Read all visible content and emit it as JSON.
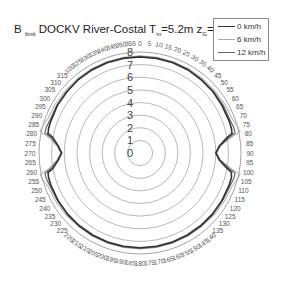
{
  "chart_data": {
    "type": "polar-line",
    "title": {
      "prefix": "B",
      "prefix_sub": "limit",
      "main": "DOCKV River-Costal T",
      "t_sub": "m",
      "t_value": "=5.2m z",
      "z_sub": "G",
      "z_value": "=16m"
    },
    "radial_axis": {
      "range": [
        0,
        8
      ],
      "ticks": [
        0,
        1,
        2,
        3,
        4,
        5,
        6,
        7,
        8
      ]
    },
    "angular_axis": {
      "unit": "degrees",
      "direction": "clockwise",
      "zero": "top",
      "step": 5,
      "range": [
        0,
        355
      ]
    },
    "legend": {
      "position": "top-right",
      "entries": [
        "0 km/h",
        "6 km/h",
        "12 km/h"
      ]
    },
    "angles": [
      0,
      10,
      20,
      30,
      40,
      50,
      60,
      70,
      75,
      78,
      80,
      85,
      90,
      95,
      100,
      102,
      105,
      110,
      120,
      130,
      140,
      150,
      160,
      170,
      180,
      190,
      200,
      210,
      220,
      230,
      240,
      250,
      255,
      258,
      260,
      265,
      270,
      275,
      280,
      282,
      285,
      290,
      300,
      310,
      320,
      330,
      340,
      350
    ],
    "series": [
      {
        "name": "0 km/h",
        "color": "#333333",
        "values": [
          7.6,
          7.6,
          7.6,
          7.6,
          7.55,
          7.55,
          7.5,
          7.5,
          7.5,
          7.45,
          7.0,
          6.3,
          6.0,
          6.3,
          7.0,
          7.4,
          7.5,
          7.5,
          7.5,
          7.5,
          7.5,
          7.5,
          7.5,
          7.5,
          7.5,
          7.5,
          7.5,
          7.5,
          7.5,
          7.5,
          7.5,
          7.5,
          7.5,
          7.45,
          7.0,
          6.5,
          6.2,
          6.5,
          7.0,
          7.45,
          7.5,
          7.5,
          7.55,
          7.55,
          7.6,
          7.6,
          7.6,
          7.6
        ]
      },
      {
        "name": "6 km/h",
        "color": "#aaaaaa",
        "values": [
          7.7,
          7.7,
          7.7,
          7.7,
          7.7,
          7.7,
          7.75,
          7.8,
          8.0,
          8.1,
          7.4,
          6.4,
          6.05,
          6.4,
          7.4,
          8.1,
          8.0,
          7.75,
          7.7,
          7.65,
          7.6,
          7.6,
          7.6,
          7.6,
          7.6,
          7.6,
          7.6,
          7.6,
          7.6,
          7.65,
          7.7,
          7.75,
          8.0,
          8.1,
          7.4,
          6.6,
          6.25,
          6.6,
          7.4,
          8.1,
          8.0,
          7.8,
          7.75,
          7.7,
          7.7,
          7.7,
          7.7,
          7.7
        ]
      },
      {
        "name": "12 km/h",
        "color": "#666666",
        "values": [
          7.65,
          7.65,
          7.65,
          7.65,
          7.6,
          7.6,
          7.6,
          7.6,
          7.7,
          7.7,
          7.2,
          6.35,
          6.05,
          6.35,
          7.2,
          7.7,
          7.7,
          7.6,
          7.55,
          7.55,
          7.55,
          7.55,
          7.55,
          7.55,
          7.55,
          7.55,
          7.55,
          7.55,
          7.55,
          7.55,
          7.55,
          7.6,
          7.7,
          7.7,
          7.2,
          6.55,
          6.25,
          6.55,
          7.2,
          7.7,
          7.7,
          7.6,
          7.6,
          7.6,
          7.6,
          7.65,
          7.65,
          7.65
        ]
      }
    ]
  }
}
